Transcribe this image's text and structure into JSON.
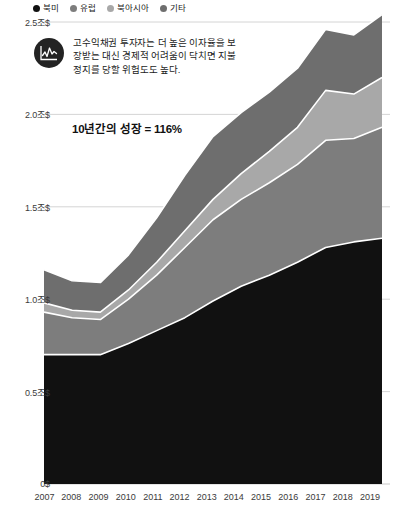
{
  "legend": {
    "items": [
      {
        "label": "북미",
        "color": "#111111"
      },
      {
        "label": "유럽",
        "color": "#7d7d7d"
      },
      {
        "label": "북아시아",
        "color": "#a8a8a8"
      },
      {
        "label": "기타",
        "color": "#6e6e6e"
      }
    ]
  },
  "annotation": {
    "icon": "chart-line-icon",
    "lines": [
      "고수익채권 투자자는 더 높은 이자율을 보",
      "장받는 대신 경제적 어려움이 닥치면 지불",
      "정지를 당할 위험도도 높다."
    ]
  },
  "growth_callout": {
    "text": "10년간의 성장 = 116%"
  },
  "chart_data": {
    "type": "area",
    "stacked": true,
    "title": "",
    "xlabel": "",
    "ylabel": "",
    "ylim": [
      0,
      2.5
    ],
    "grid": true,
    "legend_position": "top-left",
    "unit": "조$",
    "x": [
      2007,
      2008,
      2009,
      2010,
      2011,
      2012,
      2013,
      2014,
      2015,
      2016,
      2017,
      2018,
      2019
    ],
    "categories": [
      "2007",
      "2008",
      "2009",
      "2010",
      "2011",
      "2012",
      "2013",
      "2014",
      "2015",
      "2016",
      "2017",
      "2018",
      "2019"
    ],
    "ytick_labels": [
      "0$",
      "0.5조$",
      "1.0조$",
      "1.5조$",
      "2.0조$",
      "2.5조$"
    ],
    "ytick_values": [
      0,
      0.5,
      1.0,
      1.5,
      2.0,
      2.5
    ],
    "series": [
      {
        "name": "북미",
        "color": "#111111",
        "values": [
          0.7,
          0.7,
          0.7,
          0.76,
          0.83,
          0.9,
          0.99,
          1.07,
          1.13,
          1.2,
          1.28,
          1.31,
          1.33
        ]
      },
      {
        "name": "유럽",
        "color": "#7d7d7d",
        "values": [
          0.23,
          0.2,
          0.19,
          0.24,
          0.3,
          0.38,
          0.44,
          0.47,
          0.5,
          0.53,
          0.58,
          0.56,
          0.6
        ]
      },
      {
        "name": "북아시아",
        "color": "#a8a8a8",
        "values": [
          0.05,
          0.04,
          0.04,
          0.05,
          0.07,
          0.09,
          0.11,
          0.14,
          0.17,
          0.2,
          0.27,
          0.24,
          0.27
        ]
      },
      {
        "name": "기타",
        "color": "#6e6e6e",
        "values": [
          0.18,
          0.16,
          0.16,
          0.19,
          0.24,
          0.3,
          0.34,
          0.33,
          0.32,
          0.32,
          0.33,
          0.32,
          0.34
        ]
      }
    ],
    "totals": [
      1.16,
      1.1,
      1.09,
      1.24,
      1.44,
      1.67,
      1.88,
      2.01,
      2.12,
      2.25,
      2.46,
      2.43,
      2.54
    ],
    "annotation_note": "10년간의 성장 = 116%"
  }
}
